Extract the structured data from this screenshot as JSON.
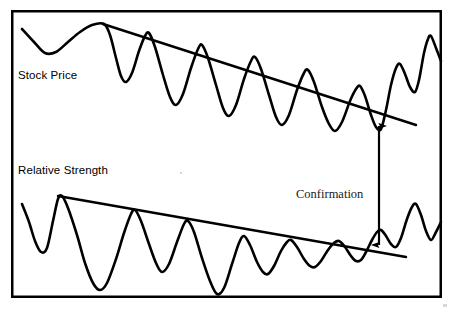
{
  "figure": {
    "background_color": "#ffffff",
    "stroke_color": "#000000",
    "border": {
      "x": 11,
      "y": 10,
      "width": 431,
      "height": 288,
      "thickness": 2.5
    }
  },
  "labels": {
    "stock_price": "Stock Price",
    "relative_strength": "Relative Strength",
    "confirmation": "Confirmation"
  },
  "chart_data": {
    "type": "line",
    "xlabel": "",
    "ylabel": "",
    "grid": false,
    "legend": "none",
    "xlim": [
      11,
      442
    ],
    "ylim_inverted_pixels": [
      10,
      298
    ],
    "series": [
      {
        "name": "Stock Price",
        "label_position": {
          "x": 18,
          "y": 79
        },
        "note": "Upper oscillating price curve making lower highs, breaking out above downtrend line at right",
        "path_points": [
          [
            22,
            29
          ],
          [
            34,
            42
          ],
          [
            45,
            53
          ],
          [
            56,
            52
          ],
          [
            68,
            42
          ],
          [
            80,
            32
          ],
          [
            92,
            25
          ],
          [
            104,
            24
          ],
          [
            110,
            35
          ],
          [
            116,
            58
          ],
          [
            121,
            76
          ],
          [
            126,
            82
          ],
          [
            132,
            73
          ],
          [
            139,
            51
          ],
          [
            145,
            36
          ],
          [
            149,
            33
          ],
          [
            155,
            47
          ],
          [
            163,
            75
          ],
          [
            170,
            97
          ],
          [
            176,
            105
          ],
          [
            183,
            94
          ],
          [
            191,
            68
          ],
          [
            198,
            49
          ],
          [
            202,
            45
          ],
          [
            208,
            58
          ],
          [
            216,
            85
          ],
          [
            223,
            108
          ],
          [
            229,
            116
          ],
          [
            236,
            105
          ],
          [
            244,
            79
          ],
          [
            251,
            61
          ],
          [
            255,
            57
          ],
          [
            261,
            69
          ],
          [
            269,
            95
          ],
          [
            276,
            117
          ],
          [
            282,
            125
          ],
          [
            289,
            115
          ],
          [
            297,
            90
          ],
          [
            304,
            73
          ],
          [
            308,
            70
          ],
          [
            314,
            82
          ],
          [
            322,
            107
          ],
          [
            329,
            124
          ],
          [
            335,
            131
          ],
          [
            342,
            122
          ],
          [
            350,
            101
          ],
          [
            356,
            89
          ],
          [
            360,
            86
          ],
          [
            365,
            96
          ],
          [
            371,
            115
          ],
          [
            376,
            127
          ],
          [
            381,
            129
          ],
          [
            386,
            110
          ],
          [
            391,
            85
          ],
          [
            396,
            68
          ],
          [
            400,
            64
          ],
          [
            405,
            74
          ],
          [
            410,
            87
          ],
          [
            415,
            92
          ],
          [
            419,
            80
          ],
          [
            424,
            53
          ],
          [
            428,
            39
          ],
          [
            431,
            36
          ],
          [
            436,
            48
          ],
          [
            441,
            61
          ]
        ]
      },
      {
        "name": "Relative Strength",
        "label_position": {
          "x": 18,
          "y": 174
        },
        "note": "Lower oscillating indicator curve making lower highs, confirming the price downtrend and breaking out at right",
        "path_points": [
          [
            22,
            204
          ],
          [
            29,
            222
          ],
          [
            35,
            241
          ],
          [
            41,
            252
          ],
          [
            47,
            248
          ],
          [
            53,
            221
          ],
          [
            58,
            199
          ],
          [
            62,
            196
          ],
          [
            68,
            208
          ],
          [
            77,
            235
          ],
          [
            85,
            263
          ],
          [
            93,
            283
          ],
          [
            100,
            290
          ],
          [
            107,
            283
          ],
          [
            116,
            259
          ],
          [
            124,
            233
          ],
          [
            131,
            214
          ],
          [
            135,
            210
          ],
          [
            141,
            221
          ],
          [
            149,
            244
          ],
          [
            156,
            263
          ],
          [
            162,
            272
          ],
          [
            169,
            264
          ],
          [
            177,
            242
          ],
          [
            184,
            224
          ],
          [
            188,
            221
          ],
          [
            194,
            232
          ],
          [
            202,
            258
          ],
          [
            210,
            281
          ],
          [
            217,
            294
          ],
          [
            224,
            288
          ],
          [
            232,
            264
          ],
          [
            239,
            243
          ],
          [
            244,
            236
          ],
          [
            250,
            245
          ],
          [
            257,
            262
          ],
          [
            263,
            272
          ],
          [
            268,
            274
          ],
          [
            274,
            266
          ],
          [
            281,
            251
          ],
          [
            287,
            242
          ],
          [
            291,
            240
          ],
          [
            297,
            247
          ],
          [
            304,
            259
          ],
          [
            310,
            266
          ],
          [
            315,
            267
          ],
          [
            321,
            261
          ],
          [
            328,
            250
          ],
          [
            334,
            243
          ],
          [
            339,
            241
          ],
          [
            345,
            247
          ],
          [
            351,
            256
          ],
          [
            356,
            261
          ],
          [
            361,
            260
          ],
          [
            366,
            252
          ],
          [
            372,
            240
          ],
          [
            377,
            232
          ],
          [
            381,
            230
          ],
          [
            386,
            236
          ],
          [
            391,
            244
          ],
          [
            396,
            247
          ],
          [
            401,
            238
          ],
          [
            407,
            219
          ],
          [
            412,
            207
          ],
          [
            416,
            204
          ],
          [
            421,
            215
          ],
          [
            426,
            231
          ],
          [
            431,
            240
          ],
          [
            436,
            232
          ],
          [
            441,
            222
          ]
        ]
      }
    ],
    "trendlines": [
      {
        "name": "stock-price-downtrend-line",
        "x1": 103,
        "y1": 24,
        "x2": 416,
        "y2": 125,
        "description": "Descending resistance line connecting lower highs of stock price"
      },
      {
        "name": "relative-strength-downtrend-line",
        "x1": 58,
        "y1": 196,
        "x2": 406,
        "y2": 257,
        "description": "Descending resistance line connecting lower highs of relative strength"
      }
    ],
    "annotations": [
      {
        "name": "confirmation-arrow",
        "type": "double-headed-vertical-arrow",
        "x": 379,
        "y_top": 126,
        "y_bottom": 245,
        "label": "Confirmation",
        "label_x": 296,
        "label_y": 198,
        "description": "Vertical double arrow linking the stock price breakout to the matching relative strength breakout"
      }
    ]
  }
}
